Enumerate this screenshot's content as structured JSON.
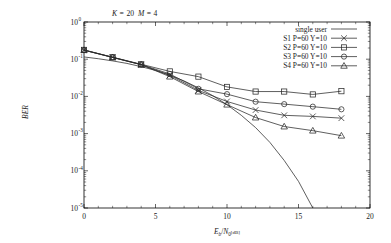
{
  "chart_data": {
    "type": "line",
    "title_parts": {
      "k_symbol": "K",
      "k_eq": "=",
      "k_value": "20",
      "m_symbol": "M",
      "m_eq": "=",
      "m_value": "4"
    },
    "xlabel": "Eb/N0[dB]",
    "xlabel_parts": {
      "main": "E",
      "sub": "b",
      "slash": "/",
      "n": "N",
      "nsub": "0",
      "unit": "[dB]"
    },
    "ylabel": "BER",
    "xlim": [
      0,
      20
    ],
    "ylim": [
      1e-05,
      1
    ],
    "yscale": "log",
    "xticks": [
      0,
      5,
      10,
      15,
      20
    ],
    "xtick_labels": [
      "0",
      "5",
      "10",
      "15",
      "20"
    ],
    "yticks": [
      1,
      0.1,
      0.01,
      0.001,
      0.0001,
      1e-05
    ],
    "ytick_labels": [
      "10^0",
      "10^-1",
      "10^-2",
      "10^-3",
      "10^-4",
      "10^-5"
    ],
    "ytick_mantissa": "10",
    "ytick_exponents": [
      "0",
      "-1",
      "-2",
      "-3",
      "-4",
      "-5"
    ],
    "grid": false,
    "legend_position": "upper right",
    "series": [
      {
        "name": "single user",
        "marker": "none",
        "x": [
          0,
          1,
          2,
          3,
          4,
          5,
          6,
          7,
          8,
          9,
          10,
          11,
          12,
          13,
          14,
          15,
          16
        ],
        "y": [
          0.115,
          0.103,
          0.09,
          0.077,
          0.063,
          0.05,
          0.037,
          0.026,
          0.017,
          0.0105,
          0.006,
          0.0031,
          0.00145,
          0.00058,
          0.00019,
          5.2e-05,
          1e-05
        ]
      },
      {
        "name": "S1 P=60 Y=10",
        "marker": "cross",
        "x": [
          0,
          2,
          4,
          6,
          8,
          10,
          12,
          14,
          16,
          18
        ],
        "y": [
          0.175,
          0.112,
          0.071,
          0.037,
          0.0145,
          0.0073,
          0.0043,
          0.0031,
          0.0029,
          0.0026
        ]
      },
      {
        "name": "S2 P=60 Y=10",
        "marker": "square",
        "x": [
          0,
          2,
          4,
          6,
          8,
          10,
          12,
          14,
          16,
          18
        ],
        "y": [
          0.178,
          0.113,
          0.073,
          0.047,
          0.034,
          0.018,
          0.0135,
          0.0135,
          0.0113,
          0.0138
        ]
      },
      {
        "name": "S3 P=60 Y=10",
        "marker": "circle",
        "x": [
          0,
          2,
          4,
          6,
          8,
          10,
          12,
          14,
          16,
          18
        ],
        "y": [
          0.176,
          0.112,
          0.072,
          0.04,
          0.016,
          0.0115,
          0.0072,
          0.0062,
          0.0053,
          0.0045
        ]
      },
      {
        "name": "S4 P=60 Y=10",
        "marker": "triangle",
        "x": [
          0,
          2,
          4,
          6,
          8,
          10,
          12,
          14,
          16,
          18
        ],
        "y": [
          0.175,
          0.112,
          0.071,
          0.034,
          0.0135,
          0.006,
          0.0027,
          0.00155,
          0.0012,
          0.00088
        ]
      }
    ]
  }
}
